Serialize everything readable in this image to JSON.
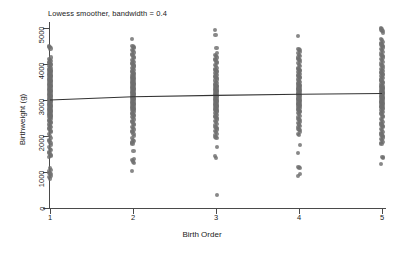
{
  "chart_data": {
    "type": "scatter",
    "title": "Lowess smoother, bandwidth = 0.4",
    "xlabel": "Birth Order",
    "ylabel": "Birthweight (g)",
    "xlim": [
      0.6,
      5.4
    ],
    "ylim": [
      0,
      5400
    ],
    "grid": false,
    "legend": null,
    "x_ticks": [
      1,
      2,
      3,
      4,
      5
    ],
    "x_tick_labels": [
      "1",
      "2",
      "3",
      "4",
      "5"
    ],
    "y_ticks": [
      0,
      1000,
      2000,
      3000,
      4000,
      5000
    ],
    "y_tick_labels": [
      "0",
      "1000",
      "2000",
      "3000",
      "4000",
      "5000"
    ],
    "marker_color": "#6e6e6e",
    "line_color": "#333333",
    "axis_color": "#4a4a4a",
    "background": "#ffffff",
    "smoother": {
      "name": "lowess",
      "bandwidth": 0.4,
      "x": [
        1,
        2,
        3,
        4,
        5
      ],
      "y": [
        3000,
        3090,
        3130,
        3160,
        3180
      ]
    },
    "series": [
      {
        "name": "Birth Order 1",
        "x_value": 1,
        "y_values": [
          4500,
          4470,
          4430,
          4180,
          4150,
          4120,
          4090,
          4060,
          4030,
          4000,
          3970,
          3940,
          3910,
          3880,
          3860,
          3840,
          3820,
          3800,
          3780,
          3760,
          3740,
          3720,
          3700,
          3680,
          3660,
          3640,
          3620,
          3600,
          3580,
          3560,
          3540,
          3520,
          3500,
          3480,
          3460,
          3440,
          3420,
          3400,
          3380,
          3360,
          3340,
          3320,
          3300,
          3280,
          3260,
          3240,
          3220,
          3200,
          3180,
          3160,
          3140,
          3120,
          3100,
          3080,
          3060,
          3040,
          3020,
          3000,
          2980,
          2960,
          2940,
          2920,
          2900,
          2880,
          2860,
          2840,
          2820,
          2800,
          2780,
          2760,
          2740,
          2720,
          2700,
          2680,
          2660,
          2640,
          2620,
          2600,
          2580,
          2560,
          2540,
          2520,
          2500,
          2470,
          2440,
          2410,
          2380,
          2350,
          2320,
          2290,
          2260,
          2230,
          2200,
          2150,
          2100,
          2050,
          2000,
          1950,
          1900,
          1850,
          1800,
          1750,
          1700,
          1650,
          1600,
          1560,
          1520,
          1480,
          1440,
          1420,
          1100,
          1060,
          1020,
          980,
          940,
          900,
          860,
          820
        ]
      },
      {
        "name": "Birth Order 2",
        "x_value": 2,
        "y_values": [
          4700,
          4510,
          4480,
          4440,
          4400,
          4360,
          4320,
          4280,
          4240,
          4200,
          4160,
          4120,
          4080,
          4050,
          4020,
          3990,
          3960,
          3930,
          3900,
          3870,
          3840,
          3810,
          3780,
          3750,
          3720,
          3700,
          3680,
          3660,
          3640,
          3620,
          3600,
          3580,
          3560,
          3540,
          3520,
          3500,
          3480,
          3460,
          3440,
          3420,
          3400,
          3380,
          3360,
          3340,
          3320,
          3300,
          3280,
          3260,
          3240,
          3220,
          3200,
          3180,
          3160,
          3140,
          3120,
          3100,
          3080,
          3060,
          3040,
          3020,
          3000,
          2980,
          2960,
          2940,
          2920,
          2900,
          2880,
          2860,
          2840,
          2820,
          2800,
          2780,
          2760,
          2740,
          2720,
          2700,
          2680,
          2650,
          2620,
          2590,
          2560,
          2530,
          2500,
          2460,
          2420,
          2380,
          2340,
          2300,
          2260,
          2220,
          2180,
          2140,
          2100,
          2050,
          2000,
          1950,
          1900,
          1850,
          1820,
          1790,
          1590,
          1370,
          1330,
          1290,
          1250,
          1030
        ]
      },
      {
        "name": "Birth Order 3",
        "x_value": 3,
        "y_values": [
          4950,
          4800,
          4450,
          4300,
          4260,
          4220,
          4180,
          4140,
          4100,
          4060,
          4020,
          3980,
          3940,
          3900,
          3870,
          3840,
          3810,
          3780,
          3750,
          3720,
          3690,
          3660,
          3630,
          3600,
          3570,
          3540,
          3510,
          3480,
          3450,
          3420,
          3400,
          3380,
          3360,
          3340,
          3320,
          3300,
          3280,
          3260,
          3240,
          3220,
          3200,
          3180,
          3160,
          3140,
          3120,
          3100,
          3080,
          3060,
          3040,
          3020,
          3000,
          2980,
          2960,
          2940,
          2920,
          2900,
          2880,
          2860,
          2840,
          2820,
          2800,
          2780,
          2760,
          2740,
          2720,
          2700,
          2680,
          2650,
          2620,
          2590,
          2560,
          2530,
          2500,
          2460,
          2420,
          2380,
          2340,
          2300,
          2260,
          2220,
          2180,
          2140,
          2100,
          2060,
          2020,
          1980,
          1940,
          1700,
          1450,
          1400,
          350
        ]
      },
      {
        "name": "Birth Order 4",
        "x_value": 4,
        "y_values": [
          4780,
          4420,
          4380,
          4340,
          4300,
          4260,
          4220,
          4180,
          4140,
          4100,
          4060,
          4020,
          3980,
          3940,
          3900,
          3870,
          3840,
          3810,
          3780,
          3750,
          3720,
          3690,
          3660,
          3630,
          3600,
          3570,
          3540,
          3510,
          3480,
          3450,
          3420,
          3400,
          3380,
          3360,
          3340,
          3320,
          3300,
          3280,
          3260,
          3240,
          3220,
          3200,
          3180,
          3160,
          3140,
          3120,
          3100,
          3080,
          3060,
          3040,
          3020,
          3000,
          2980,
          2960,
          2940,
          2920,
          2900,
          2880,
          2860,
          2840,
          2820,
          2800,
          2780,
          2750,
          2720,
          2690,
          2660,
          2630,
          2600,
          2560,
          2520,
          2480,
          2440,
          2400,
          2360,
          2320,
          2280,
          2240,
          2200,
          2160,
          2120,
          2060,
          2030,
          1750,
          1530,
          1150,
          1100,
          940,
          900
        ]
      },
      {
        "name": "Birth Order 5",
        "x_value": 5,
        "y_values": [
          5000,
          4960,
          4920,
          4870,
          4700,
          4660,
          4620,
          4580,
          4540,
          4500,
          4460,
          4420,
          4380,
          4340,
          4300,
          4260,
          4220,
          4180,
          4140,
          4100,
          4060,
          4020,
          3980,
          3940,
          3900,
          3870,
          3840,
          3810,
          3780,
          3750,
          3720,
          3690,
          3660,
          3630,
          3600,
          3570,
          3540,
          3510,
          3480,
          3450,
          3420,
          3400,
          3380,
          3360,
          3340,
          3320,
          3300,
          3280,
          3260,
          3240,
          3220,
          3200,
          3180,
          3160,
          3140,
          3120,
          3100,
          3080,
          3060,
          3040,
          3020,
          3000,
          2980,
          2960,
          2940,
          2920,
          2900,
          2880,
          2860,
          2840,
          2820,
          2800,
          2780,
          2750,
          2720,
          2690,
          2660,
          2630,
          2600,
          2560,
          2520,
          2480,
          2440,
          2400,
          2360,
          2320,
          2280,
          2240,
          2200,
          2160,
          2120,
          2080,
          2040,
          2000,
          1960,
          1920,
          1880,
          1840,
          1800,
          1780,
          1420,
          1380,
          1220
        ]
      }
    ]
  }
}
